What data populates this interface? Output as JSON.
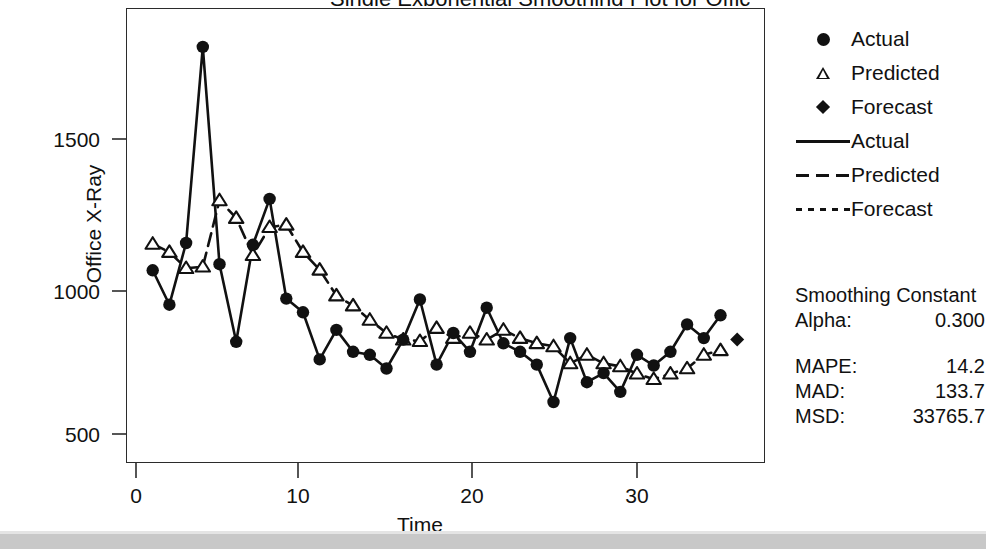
{
  "axes": {
    "y_title": "Office X-Ray",
    "x_title": "Time",
    "y_ticks": [
      "1500",
      "1000",
      "500"
    ],
    "x_ticks": [
      "0",
      "10",
      "20",
      "30"
    ]
  },
  "legend": {
    "items": [
      {
        "label": "Actual",
        "symbol": "filled-circle-marker"
      },
      {
        "label": "Predicted",
        "symbol": "open-triangle-marker"
      },
      {
        "label": "Forecast",
        "symbol": "filled-diamond-marker"
      },
      {
        "label": "Actual",
        "symbol": "solid-line"
      },
      {
        "label": "Predicted",
        "symbol": "dashed-line"
      },
      {
        "label": "Forecast",
        "symbol": "dotted-line"
      }
    ]
  },
  "stats": {
    "heading": "Smoothing Constant",
    "alpha_label": "Alpha:",
    "alpha_value": "0.300",
    "mape_label": "MAPE:",
    "mape_value": "14.2",
    "mad_label": "MAD:",
    "mad_value": "133.7",
    "msd_label": "MSD:",
    "msd_value": "33765.7"
  },
  "colors": {
    "ink": "#111111",
    "frame": "#2b2b2b",
    "band": "#c8c8c8"
  },
  "chart_data": {
    "type": "line",
    "title": "Single Exponential Smoothing Plot for Office X-Ray",
    "xlabel": "Time",
    "ylabel": "Office X-Ray",
    "xlim": [
      0,
      38
    ],
    "ylim": [
      420,
      1860
    ],
    "grid": false,
    "legend_position": "right",
    "x": [
      1,
      2,
      3,
      4,
      5,
      6,
      7,
      8,
      9,
      10,
      11,
      12,
      13,
      14,
      15,
      16,
      17,
      18,
      19,
      20,
      21,
      22,
      23,
      24,
      25,
      26,
      27,
      28,
      29,
      30,
      31,
      32,
      33,
      34,
      35
    ],
    "series": [
      {
        "name": "Actual",
        "marker": "filled-circle",
        "line": "solid",
        "values": [
          1068,
          955,
          1158,
          1803,
          1088,
          833,
          1152,
          1303,
          975,
          930,
          775,
          872,
          800,
          790,
          745,
          840,
          972,
          758,
          862,
          800,
          945,
          828,
          800,
          758,
          635,
          845,
          700,
          730,
          668,
          790,
          755,
          800,
          890,
          845,
          920
        ]
      },
      {
        "name": "Predicted",
        "marker": "open-triangle",
        "line": "dashed",
        "values": [
          1155,
          1128,
          1075,
          1080,
          1298,
          1240,
          1118,
          1210,
          1218,
          1128,
          1070,
          985,
          952,
          905,
          862,
          840,
          835,
          878,
          845,
          862,
          840,
          872,
          845,
          828,
          818,
          762,
          790,
          762,
          752,
          728,
          710,
          728,
          745,
          790,
          805
        ]
      },
      {
        "name": "Forecast",
        "marker": "filled-diamond",
        "line": "dotted",
        "x": [
          36
        ],
        "values": [
          840
        ]
      }
    ]
  }
}
